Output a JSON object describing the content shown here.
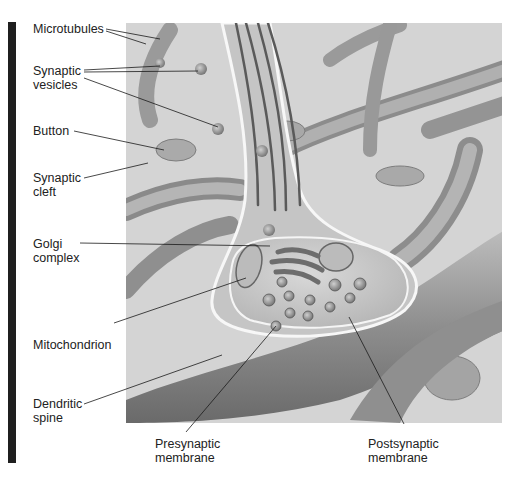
{
  "figure": {
    "colors": {
      "background": "#ffffff",
      "panel": "#d6d6d6",
      "side_bar": "#1f1f1f",
      "leader_line": "#1a1a1a"
    }
  },
  "labels": {
    "microtubules": "Microtubules",
    "synaptic_vesicles": "Synaptic\nvesicles",
    "button": "Button",
    "synaptic_cleft": "Synaptic\ncleft",
    "golgi_complex": "Golgi\ncomplex",
    "mitochondrion": "Mitochondrion",
    "dendritic_spine": "Dendritic\nspine",
    "presynaptic_membrane": "Presynaptic\nmembrane",
    "postsynaptic_membrane": "Postsynaptic\nmembrane"
  }
}
